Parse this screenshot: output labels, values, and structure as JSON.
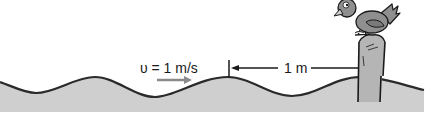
{
  "diagram": {
    "velocity_label": "υ = 1 m/s",
    "distance_label": "1 m",
    "colors": {
      "water": "#cfcfcf",
      "wave_line": "#2a2a2a",
      "arrow_velocity": "#8a8a8a",
      "arrow_distance": "#1a1a1a",
      "bird": "#8f8f8f",
      "post": "#b5b5b5"
    },
    "elements": [
      "wave-surface",
      "velocity-arrow",
      "distance-marker",
      "post",
      "bird"
    ]
  }
}
